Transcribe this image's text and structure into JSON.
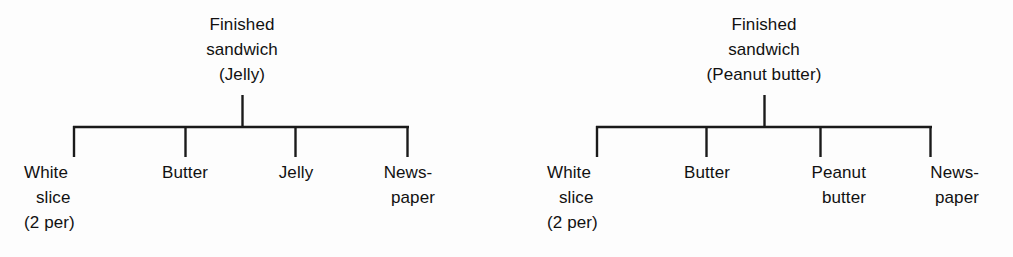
{
  "page": {
    "background_color": "#fdfdfd",
    "line_color": "#1a1a1a"
  },
  "diagrams": [
    {
      "id": "jelly-sandwich-tree",
      "root": {
        "lines": [
          "Finished",
          "sandwich",
          "(Jelly)"
        ],
        "text": "Finished sandwich (Jelly)"
      },
      "children": [
        {
          "lines": [
            "White",
            "slice",
            "(2 per)"
          ],
          "text": "White slice (2 per)",
          "align": "left"
        },
        {
          "lines": [
            "Butter"
          ],
          "text": "Butter",
          "align": "center"
        },
        {
          "lines": [
            "Jelly"
          ],
          "text": "Jelly",
          "align": "center"
        },
        {
          "lines": [
            "News-",
            "paper"
          ],
          "text": "Newspaper",
          "align": "center"
        }
      ]
    },
    {
      "id": "peanut-butter-sandwich-tree",
      "root": {
        "lines": [
          "Finished",
          "sandwich",
          "(Peanut butter)"
        ],
        "text": "Finished sandwich (Peanut butter)"
      },
      "children": [
        {
          "lines": [
            "White",
            "slice",
            "(2 per)"
          ],
          "text": "White slice (2 per)",
          "align": "left"
        },
        {
          "lines": [
            "Butter"
          ],
          "text": "Butter",
          "align": "center"
        },
        {
          "lines": [
            "Peanut",
            "butter"
          ],
          "text": "Peanut butter",
          "align": "right"
        },
        {
          "lines": [
            "News-",
            "paper"
          ],
          "text": "Newspaper",
          "align": "right"
        }
      ]
    }
  ]
}
